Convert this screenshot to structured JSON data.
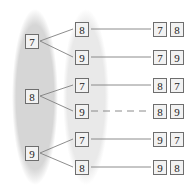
{
  "diagram": {
    "ellipses": [
      {
        "name": "left-group",
        "fill": "#d6d6d6",
        "cx": 35,
        "cy": 97,
        "rx": 23,
        "ry": 88
      },
      {
        "name": "middle-group",
        "fill": "#e9e9e9",
        "cx": 86,
        "cy": 97,
        "rx": 23,
        "ry": 88
      }
    ],
    "level1": [
      {
        "value": "7",
        "x": 25,
        "y": 34
      },
      {
        "value": "8",
        "x": 25,
        "y": 89
      },
      {
        "value": "9",
        "x": 25,
        "y": 146
      }
    ],
    "level2": [
      {
        "value": "8",
        "x": 75,
        "y": 22
      },
      {
        "value": "9",
        "x": 75,
        "y": 50
      },
      {
        "value": "7",
        "x": 75,
        "y": 78
      },
      {
        "value": "9",
        "x": 75,
        "y": 104
      },
      {
        "value": "7",
        "x": 75,
        "y": 132
      },
      {
        "value": "8",
        "x": 75,
        "y": 160
      }
    ],
    "outcomes": [
      {
        "first": "7",
        "second": "8",
        "x": 153,
        "y": 22
      },
      {
        "first": "7",
        "second": "9",
        "x": 153,
        "y": 50
      },
      {
        "first": "8",
        "second": "7",
        "x": 153,
        "y": 78
      },
      {
        "first": "8",
        "second": "9",
        "x": 153,
        "y": 104
      },
      {
        "first": "9",
        "second": "7",
        "x": 153,
        "y": 132
      },
      {
        "first": "9",
        "second": "8",
        "x": 153,
        "y": 160
      }
    ],
    "branch_edges": [
      {
        "x1": 40,
        "y1": 41,
        "x2": 73,
        "y2": 29
      },
      {
        "x1": 40,
        "y1": 41,
        "x2": 73,
        "y2": 57
      },
      {
        "x1": 40,
        "y1": 96,
        "x2": 73,
        "y2": 85
      },
      {
        "x1": 40,
        "y1": 96,
        "x2": 73,
        "y2": 111
      },
      {
        "x1": 40,
        "y1": 153,
        "x2": 73,
        "y2": 139
      },
      {
        "x1": 40,
        "y1": 153,
        "x2": 73,
        "y2": 167
      }
    ],
    "outcome_edges": [
      {
        "x1": 91,
        "y1": 29,
        "x2": 151,
        "y2": 29,
        "dashed": false
      },
      {
        "x1": 91,
        "y1": 57,
        "x2": 151,
        "y2": 57,
        "dashed": false
      },
      {
        "x1": 91,
        "y1": 85,
        "x2": 151,
        "y2": 85,
        "dashed": false
      },
      {
        "x1": 91,
        "y1": 111,
        "x2": 151,
        "y2": 111,
        "dashed": true
      },
      {
        "x1": 91,
        "y1": 139,
        "x2": 151,
        "y2": 139,
        "dashed": false
      },
      {
        "x1": 91,
        "y1": 167,
        "x2": 151,
        "y2": 167,
        "dashed": false
      }
    ],
    "colors": {
      "line": "#808080",
      "box_border": "#6e6e6e",
      "box_fill": "#f2f2f2",
      "text": "#1c1c1c",
      "background": "#ffffff"
    }
  }
}
